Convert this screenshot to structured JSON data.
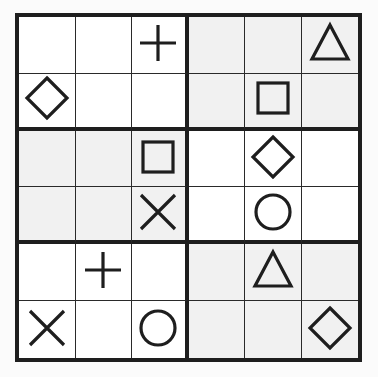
{
  "puzzle": {
    "type": "symbol-sudoku",
    "size": 6,
    "box_width": 3,
    "box_height": 2,
    "colors": {
      "shaded": "#f1f1f1",
      "white": "#ffffff",
      "ink": "#1e1e1e"
    },
    "shaded_boxes": [
      [
        0,
        1
      ],
      [
        1,
        0
      ],
      [
        2,
        1
      ]
    ],
    "grid": [
      [
        "",
        "",
        "plus",
        "",
        "",
        "triangle"
      ],
      [
        "diamond",
        "",
        "",
        "",
        "square",
        ""
      ],
      [
        "",
        "",
        "square",
        "",
        "diamond",
        ""
      ],
      [
        "",
        "",
        "cross",
        "",
        "circle",
        ""
      ],
      [
        "",
        "plus",
        "",
        "",
        "triangle",
        ""
      ],
      [
        "cross",
        "",
        "circle",
        "",
        "",
        "diamond"
      ]
    ]
  }
}
